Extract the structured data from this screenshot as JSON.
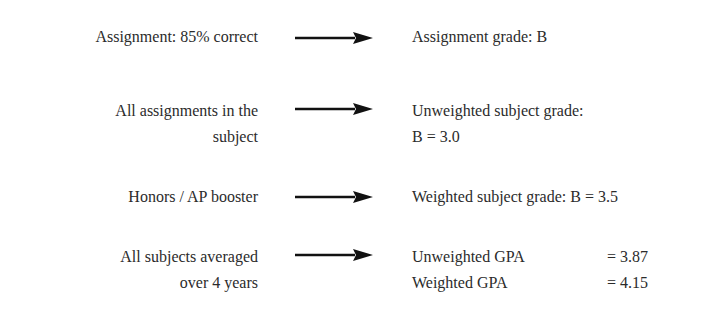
{
  "rows": [
    {
      "input": [
        "Assignment: 85% correct"
      ],
      "output": [
        "Assignment grade: B"
      ]
    },
    {
      "input": [
        "All assignments in the",
        "subject"
      ],
      "output": [
        "Unweighted subject grade:",
        "B = 3.0"
      ]
    },
    {
      "input": [
        "Honors / AP booster"
      ],
      "output": [
        "Weighted subject grade: B = 3.5"
      ]
    },
    {
      "input": [
        "All subjects averaged",
        "over 4 years"
      ],
      "output_gpa": [
        {
          "label": "Unweighted GPA",
          "value": "= 3.87"
        },
        {
          "label": "Weighted GPA",
          "value": "= 4.15"
        }
      ]
    }
  ],
  "colors": {
    "text": "#2b2b2b",
    "arrow": "#111111",
    "background": "#ffffff"
  },
  "icons": {
    "arrow": "right-arrow-icon"
  }
}
